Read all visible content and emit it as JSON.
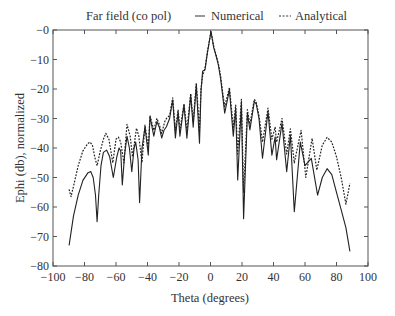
{
  "chart_data": {
    "type": "line",
    "title": "Far field (co pol)",
    "xlabel": "Theta (degrees)",
    "ylabel": "Ephi (db), normalized",
    "xlim": [
      -100,
      100
    ],
    "ylim": [
      -80,
      0
    ],
    "xticks": [
      -100,
      -80,
      -60,
      -40,
      -20,
      0,
      20,
      40,
      60,
      80,
      100
    ],
    "xtick_labels": [
      "−100",
      "−80",
      "−60",
      "−40",
      "−20",
      "0",
      "20",
      "40",
      "60",
      "80",
      "100"
    ],
    "yticks": [
      0,
      -10,
      -20,
      -30,
      -40,
      -50,
      -60,
      -70,
      -80
    ],
    "ytick_labels": [
      "−0",
      "−10",
      "−20",
      "−30",
      "−40",
      "−50",
      "−60",
      "−70",
      "−80"
    ],
    "grid": false,
    "legend_position": "top",
    "series": [
      {
        "name": "Numerical",
        "style": "solid",
        "color": "#222222",
        "x": [
          -89.8,
          -87,
          -84,
          -81,
          -78,
          -76,
          -74.5,
          -73,
          -72,
          -71,
          -69.5,
          -68,
          -66,
          -64,
          -61.7,
          -59.5,
          -58,
          -57,
          -56,
          -54.5,
          -53,
          -51.5,
          -50,
          -48.5,
          -47.5,
          -46,
          -45,
          -43.5,
          -41.6,
          -39.5,
          -38.4,
          -36,
          -34,
          -32.5,
          -31,
          -29.5,
          -28,
          -26,
          -24,
          -22.3,
          -20.6,
          -19.4,
          -16.8,
          -15,
          -12.6,
          -11,
          -9,
          -7,
          -6,
          -5,
          -3.5,
          -2,
          0.3,
          2,
          3.8,
          5,
          6.4,
          7.3,
          9,
          12,
          14.5,
          16,
          17.3,
          19.6,
          21,
          23.4,
          25,
          27.8,
          29,
          30.8,
          33,
          36.5,
          39,
          41,
          42,
          45.4,
          48.4,
          50.7,
          53.2,
          57,
          60,
          64,
          68,
          71,
          74,
          77,
          80,
          83,
          86,
          88.5
        ],
        "y": [
          -73,
          -63,
          -56,
          -51,
          -48.5,
          -48,
          -50,
          -56,
          -65,
          -56,
          -46,
          -41.5,
          -40.7,
          -43,
          -50,
          -43,
          -40,
          -41,
          -52.5,
          -42,
          -36,
          -40,
          -48,
          -40,
          -38,
          -44,
          -58.5,
          -40,
          -32.8,
          -42.4,
          -29.4,
          -36,
          -31,
          -33,
          -36.6,
          -34,
          -32.8,
          -30,
          -23.7,
          -36.6,
          -27.7,
          -36,
          -25.4,
          -36.7,
          -22,
          -33,
          -18.6,
          -38.4,
          -20.8,
          -14,
          -13.5,
          -8,
          -0.5,
          -6,
          -9.3,
          -11.9,
          -16.4,
          -20.3,
          -28.2,
          -20.3,
          -36,
          -26.6,
          -50.8,
          -24.8,
          -64,
          -28.2,
          -33.9,
          -24.3,
          -25,
          -30,
          -43.5,
          -27.7,
          -42.4,
          -36.3,
          -44,
          -31.6,
          -48,
          -35.6,
          -61.6,
          -38,
          -46,
          -43.5,
          -56,
          -50,
          -47,
          -49,
          -55,
          -61,
          -67,
          -75
        ]
      },
      {
        "name": "Analytical",
        "style": "dashed",
        "color": "#222222",
        "x": [
          -89.8,
          -88.6,
          -87,
          -84,
          -81,
          -78,
          -76.5,
          -75,
          -73.5,
          -72,
          -70,
          -68,
          -66.5,
          -64.5,
          -62,
          -60,
          -58.5,
          -57,
          -55,
          -53,
          -51,
          -49.5,
          -47,
          -45.5,
          -43.5,
          -41.6,
          -39.5,
          -38.4,
          -36,
          -34,
          -32.5,
          -31,
          -29,
          -28,
          -26,
          -24,
          -22.3,
          -20.6,
          -19.4,
          -16.8,
          -15,
          -12.6,
          -11,
          -9,
          -7,
          -6,
          -5,
          -3.5,
          -2,
          0.3,
          2,
          3.8,
          5,
          6.4,
          7.3,
          9,
          12,
          14.5,
          16,
          17.3,
          19.6,
          21,
          23.4,
          25,
          27.8,
          29,
          30.8,
          33,
          36.5,
          39,
          41,
          42,
          45.4,
          48.4,
          50.7,
          53.2,
          57.5,
          60.5,
          64.5,
          67.5,
          71,
          74,
          77,
          80,
          83,
          86,
          88.5
        ],
        "y": [
          -54,
          -56.5,
          -53,
          -46,
          -41,
          -38.5,
          -38,
          -39,
          -43,
          -46,
          -41,
          -37,
          -35,
          -37,
          -45,
          -37,
          -36.3,
          -38,
          -45,
          -32,
          -36,
          -43,
          -33.3,
          -36,
          -45,
          -32.2,
          -40,
          -29,
          -34,
          -30,
          -32,
          -35,
          -31,
          -30,
          -29,
          -23,
          -34,
          -27,
          -34,
          -25,
          -34,
          -21.5,
          -31,
          -18,
          -34,
          -20,
          -15.5,
          -13,
          -7.5,
          -0.5,
          -5.5,
          -9,
          -11.5,
          -15.5,
          -19.5,
          -26,
          -19.5,
          -33,
          -25.5,
          -42,
          -23.5,
          -55,
          -27,
          -32,
          -23.5,
          -24.5,
          -29,
          -38,
          -26.5,
          -37,
          -33,
          -38,
          -30,
          -42,
          -33.5,
          -45,
          -34,
          -50,
          -36.7,
          -47.5,
          -39,
          -36.4,
          -38,
          -43,
          -50,
          -59,
          -52
        ]
      }
    ],
    "legend": [
      {
        "label": "Numerical",
        "style": "solid"
      },
      {
        "label": "Analytical",
        "style": "dashed"
      }
    ]
  }
}
